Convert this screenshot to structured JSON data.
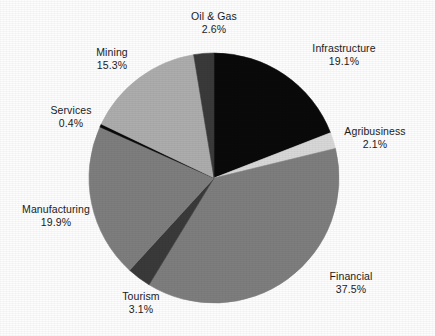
{
  "figure": {
    "background_color": "#fdfdfd",
    "text_color": "#1b1b1b"
  },
  "chart_data": {
    "type": "pie",
    "title": "",
    "subtitle": "",
    "xlabel": "",
    "ylabel": "",
    "legend_position": "none",
    "labels_position": "outside",
    "units": "percent",
    "start_angle_deg": 0,
    "direction": "clockwise",
    "center_px": {
      "x": 214,
      "y": 178
    },
    "radius_px": 125,
    "categories": [
      "Infrastructure",
      "Agribusiness",
      "Financial",
      "Tourism",
      "Manufacturing",
      "Services",
      "Mining",
      "Oil & Gas"
    ],
    "values": [
      19.1,
      2.1,
      37.5,
      3.1,
      19.9,
      0.4,
      15.3,
      2.6
    ],
    "value_labels": [
      "19.1%",
      "2.1%",
      "37.5%",
      "3.1%",
      "19.9%",
      "0.4%",
      "15.3%",
      "2.6%"
    ],
    "colors": [
      "#0a0a0a",
      "#d8d8d8",
      "#7e7e7e",
      "#3a3a3a",
      "#7e7e7e",
      "#0a0a0a",
      "#adadad",
      "#3a3a3a"
    ],
    "slices": [
      {
        "name": "Infrastructure",
        "value": 19.1,
        "value_label": "19.1%",
        "color": "#0a0a0a",
        "label_x": 344,
        "label_y": 48,
        "label_align": "left"
      },
      {
        "name": "Agribusiness",
        "value": 2.1,
        "value_label": "2.1%",
        "color": "#d8d8d8",
        "label_x": 375,
        "label_y": 131,
        "label_align": "center"
      },
      {
        "name": "Financial",
        "value": 37.5,
        "value_label": "37.5%",
        "color": "#7e7e7e",
        "label_x": 351,
        "label_y": 276,
        "label_align": "center"
      },
      {
        "name": "Tourism",
        "value": 3.1,
        "value_label": "3.1%",
        "color": "#3a3a3a",
        "label_x": 141,
        "label_y": 295,
        "label_align": "center"
      },
      {
        "name": "Manufacturing",
        "value": 19.9,
        "value_label": "19.9%",
        "color": "#7e7e7e",
        "label_x": 56,
        "label_y": 209,
        "label_align": "center"
      },
      {
        "name": "Services",
        "value": 0.4,
        "value_label": "0.4%",
        "color": "#0a0a0a",
        "label_x": 71,
        "label_y": 110,
        "label_align": "center"
      },
      {
        "name": "Mining",
        "value": 15.3,
        "value_label": "15.3%",
        "color": "#adadad",
        "label_x": 112,
        "label_y": 52,
        "label_align": "center"
      },
      {
        "name": "Oil & Gas",
        "value": 2.6,
        "value_label": "2.6%",
        "color": "#3a3a3a",
        "label_x": 214,
        "label_y": 16,
        "label_align": "center"
      }
    ]
  }
}
